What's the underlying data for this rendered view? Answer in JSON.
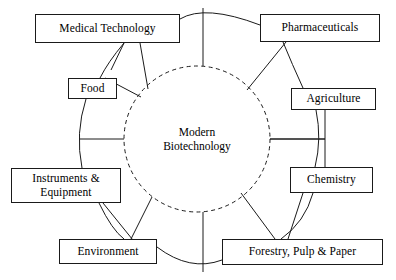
{
  "diagram": {
    "center": {
      "label": "Modern\nBiotechnology",
      "shape": "dashed-circle",
      "cx": 197,
      "cy": 139,
      "r": 73
    },
    "colors": {
      "stroke": "#1a1a1a",
      "background": "#ffffff",
      "text": "#000000"
    },
    "nodes": [
      {
        "id": "medical-technology",
        "label": "Medical Technology",
        "x": 35,
        "y": 14,
        "w": 145,
        "h": 29
      },
      {
        "id": "pharmaceuticals",
        "label": "Pharmaceuticals",
        "x": 260,
        "y": 14,
        "w": 120,
        "h": 28
      },
      {
        "id": "food",
        "label": "Food",
        "x": 68,
        "y": 78,
        "w": 49,
        "h": 21
      },
      {
        "id": "agriculture",
        "label": "Agriculture",
        "x": 291,
        "y": 88,
        "w": 85,
        "h": 22
      },
      {
        "id": "chemistry",
        "label": "Chemistry",
        "x": 290,
        "y": 167,
        "w": 83,
        "h": 26
      },
      {
        "id": "instruments-equipment",
        "label": "Instruments &\nEquipment",
        "x": 11,
        "y": 168,
        "w": 110,
        "h": 35
      },
      {
        "id": "environment",
        "label": "Environment",
        "x": 59,
        "y": 239,
        "w": 98,
        "h": 25
      },
      {
        "id": "forestry-pulp-paper",
        "label": "Forestry, Pulp & Paper",
        "x": 222,
        "y": 239,
        "w": 161,
        "h": 26
      }
    ]
  }
}
